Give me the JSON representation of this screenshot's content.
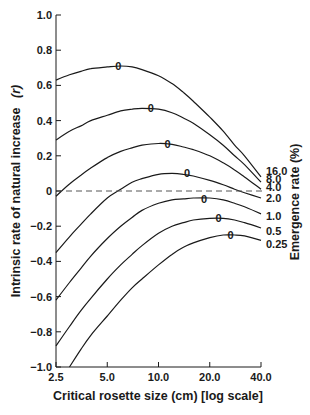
{
  "chart_data": {
    "type": "line",
    "title": "",
    "xlabel": "Critical rosette size (cm) [log scale]",
    "ylabel": "Intrinsic rate of natural increase",
    "ylabel_symbol": "(r)",
    "right_label": "Emergence rate (%)",
    "x_scale": "log",
    "xlim": [
      2.5,
      40.0
    ],
    "ylim": [
      -1.0,
      1.0
    ],
    "x_ticks": [
      "2.5",
      "5.0",
      "10.0",
      "20.0",
      "40.0"
    ],
    "y_ticks": [
      "1.0",
      "0.8",
      "0.6",
      "0.4",
      "0.2",
      "0",
      "-0.2",
      "-0.4",
      "-0.6",
      "-0.8",
      "-1.0"
    ],
    "grid": false,
    "reference_line": {
      "y": 0,
      "style": "dashed"
    },
    "peak_marker": "0",
    "x": [
      2.5,
      3.0,
      3.5,
      4.0,
      5.0,
      6.0,
      7.0,
      8.0,
      10.0,
      12.0,
      14.0,
      16.0,
      20.0,
      24.0,
      28.0,
      32.0,
      40.0
    ],
    "series": [
      {
        "name": "16.0",
        "values": [
          0.63,
          0.66,
          0.68,
          0.695,
          0.705,
          0.71,
          0.705,
          0.69,
          0.655,
          0.61,
          0.56,
          0.51,
          0.42,
          0.34,
          0.26,
          0.2,
          0.08
        ],
        "peak": {
          "x": 5.8,
          "y": 0.71
        }
      },
      {
        "name": "8.0",
        "values": [
          0.29,
          0.34,
          0.37,
          0.4,
          0.43,
          0.455,
          0.465,
          0.47,
          0.465,
          0.445,
          0.415,
          0.385,
          0.32,
          0.26,
          0.2,
          0.15,
          0.05
        ],
        "peak": {
          "x": 9.0,
          "y": 0.47
        }
      },
      {
        "name": "4.0",
        "values": [
          -0.03,
          0.04,
          0.09,
          0.13,
          0.19,
          0.225,
          0.245,
          0.26,
          0.27,
          0.265,
          0.25,
          0.235,
          0.2,
          0.16,
          0.12,
          0.08,
          0.01
        ],
        "peak": {
          "x": 11.3,
          "y": 0.265
        }
      },
      {
        "name": "2.0",
        "values": [
          -0.35,
          -0.26,
          -0.19,
          -0.13,
          -0.04,
          0.01,
          0.05,
          0.07,
          0.095,
          0.1,
          0.095,
          0.085,
          0.06,
          0.035,
          0.01,
          -0.01,
          -0.04
        ],
        "peak": {
          "x": 14.7,
          "y": 0.1
        }
      },
      {
        "name": "1.0",
        "values": [
          -0.62,
          -0.52,
          -0.44,
          -0.37,
          -0.27,
          -0.2,
          -0.15,
          -0.11,
          -0.07,
          -0.05,
          -0.045,
          -0.04,
          -0.04,
          -0.05,
          -0.07,
          -0.09,
          -0.13
        ],
        "peak": {
          "x": 18.5,
          "y": -0.045
        }
      },
      {
        "name": "0.5",
        "values": [
          -0.88,
          -0.77,
          -0.68,
          -0.61,
          -0.5,
          -0.42,
          -0.36,
          -0.31,
          -0.24,
          -0.2,
          -0.18,
          -0.165,
          -0.155,
          -0.155,
          -0.165,
          -0.18,
          -0.21
        ],
        "peak": {
          "x": 22.5,
          "y": -0.155
        }
      },
      {
        "name": "0.25",
        "values": [
          null,
          -1.0,
          -0.9,
          -0.82,
          -0.71,
          -0.62,
          -0.55,
          -0.5,
          -0.42,
          -0.36,
          -0.32,
          -0.295,
          -0.265,
          -0.25,
          -0.25,
          -0.255,
          -0.28
        ],
        "peak": {
          "x": 26.5,
          "y": -0.25
        }
      }
    ],
    "legend": {
      "position": "right, inline at curve ends",
      "entries": [
        "16.0",
        "8.0",
        "4.0",
        "2.0",
        "1.0",
        "0.5",
        "0.25"
      ]
    }
  },
  "colors": {
    "line": "#1a1a1a",
    "background": "#ffffff",
    "dashed": "#555555"
  }
}
